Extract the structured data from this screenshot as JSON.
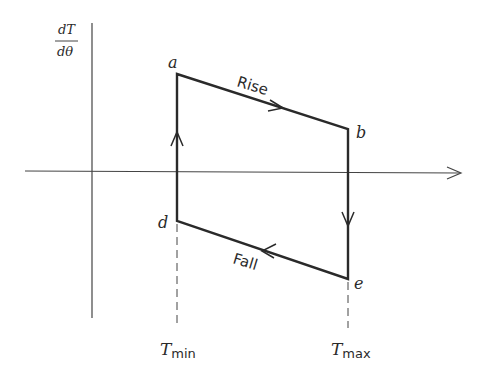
{
  "diagram": {
    "y_axis_label": {
      "numerator": "dT",
      "denominator": "dθ"
    },
    "points": {
      "a": {
        "label": "a",
        "x": 177,
        "y": 74
      },
      "b": {
        "label": "b",
        "x": 348,
        "y": 129
      },
      "e": {
        "label": "e",
        "x": 348,
        "y": 279
      },
      "d": {
        "label": "d",
        "x": 177,
        "y": 221
      }
    },
    "edge_labels": {
      "rise": "Rise",
      "fall": "Fall"
    },
    "x_ticks": {
      "t_min": {
        "base": "T",
        "sub": "min"
      },
      "t_max": {
        "base": "T",
        "sub": "max"
      }
    },
    "colors": {
      "line": "#2a2a2a",
      "axis": "#444444"
    }
  }
}
